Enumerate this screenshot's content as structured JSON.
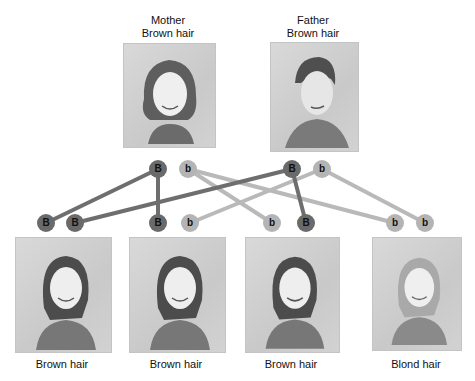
{
  "parents": [
    {
      "role": "Mother",
      "trait": "Brown hair",
      "alleles": [
        "B",
        "b"
      ]
    },
    {
      "role": "Father",
      "trait": "Brown hair",
      "alleles": [
        "B",
        "b"
      ]
    }
  ],
  "children": [
    {
      "trait": "Brown hair",
      "alleles": [
        "B",
        "B"
      ]
    },
    {
      "trait": "Brown hair",
      "alleles": [
        "B",
        "b"
      ]
    },
    {
      "trait": "Brown hair",
      "alleles": [
        "b",
        "B"
      ]
    },
    {
      "trait": "Blond hair",
      "alleles": [
        "b",
        "b"
      ]
    }
  ],
  "colors": {
    "dominant": "#6a6a6a",
    "recessive": "#b4b4b4",
    "dominant_line": "#6e6e6e",
    "recessive_line": "#b9b9b9"
  }
}
